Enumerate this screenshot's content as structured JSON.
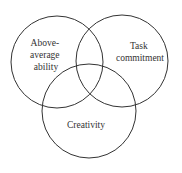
{
  "diagram": {
    "type": "venn",
    "circles": [
      {
        "id": "above-average-ability",
        "lines": [
          "Above-",
          "average",
          "ability"
        ],
        "cx": 57,
        "cy": 62,
        "r": 46
      },
      {
        "id": "task-commitment",
        "lines": [
          "Task",
          "commitment"
        ],
        "cx": 122,
        "cy": 61,
        "r": 46
      },
      {
        "id": "creativity",
        "lines": [
          "Creativity"
        ],
        "cx": 89,
        "cy": 111,
        "r": 47
      }
    ],
    "stroke_color": "#333333",
    "background": "#ffffff"
  }
}
